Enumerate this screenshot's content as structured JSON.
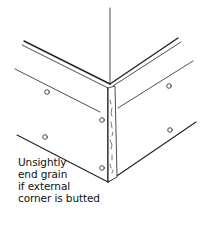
{
  "diagram": {
    "caption_lines": [
      "Unsightly",
      "end grain",
      "if external",
      "corner is butted"
    ],
    "colors": {
      "line": "#222222",
      "background": "#ffffff"
    },
    "screw_holes": 6
  }
}
